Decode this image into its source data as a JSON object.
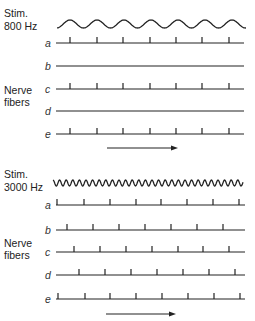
{
  "panels": [
    {
      "id": "800hz",
      "stim_label_line1": "Stim.",
      "stim_label_line2": "800 Hz",
      "stimulus_frequency_hz": 800,
      "wave": {
        "x_start": 57,
        "x_end": 246,
        "y_center": 24,
        "amplitude": 4,
        "period": 27,
        "phase_offset": 70
      },
      "group_label_line1": "Nerve",
      "group_label_line2": "fibers",
      "line_x_start": 56,
      "line_x_end": 244,
      "fibers": [
        {
          "label": "a",
          "y": 43,
          "ticks": [
            70,
            97,
            123,
            150,
            176,
            202,
            229
          ]
        },
        {
          "label": "b",
          "y": 66,
          "ticks": []
        },
        {
          "label": "c",
          "y": 89,
          "ticks": [
            70,
            97,
            123,
            150,
            176,
            202,
            229
          ]
        },
        {
          "label": "d",
          "y": 111,
          "ticks": []
        },
        {
          "label": "e",
          "y": 134,
          "ticks": [
            70,
            97,
            123,
            150,
            176,
            202,
            229
          ]
        }
      ],
      "arrow": {
        "x1": 107,
        "x2": 178,
        "y": 148,
        "meaning": "time"
      }
    },
    {
      "id": "3000hz",
      "stim_label_line1": "Stim.",
      "stim_label_line2": "3000 Hz",
      "stimulus_frequency_hz": 3000,
      "wave": {
        "x_start": 53,
        "x_end": 243,
        "y_center": 183,
        "amplitude": 3,
        "period": 6.6,
        "phase_offset": 53
      },
      "group_label_line1": "Nerve",
      "group_label_line2": "fibers",
      "line_x_start": 56,
      "line_x_end": 245,
      "fibers": [
        {
          "label": "a",
          "y": 205,
          "ticks": [
            57,
            84,
            110,
            136,
            161,
            187,
            213,
            239
          ]
        },
        {
          "label": "b",
          "y": 230,
          "ticks": [
            67,
            93,
            119,
            145,
            171,
            197,
            223
          ]
        },
        {
          "label": "c",
          "y": 252,
          "ticks": [
            74,
            100,
            126,
            152,
            178,
            203,
            229
          ]
        },
        {
          "label": "d",
          "y": 275,
          "ticks": [
            79,
            105,
            131,
            157,
            183,
            209,
            235
          ]
        },
        {
          "label": "e",
          "y": 299,
          "ticks": [
            58,
            85,
            110,
            136,
            162,
            188,
            214,
            240
          ]
        }
      ],
      "arrow": {
        "x1": 106,
        "x2": 176,
        "y": 314,
        "meaning": "time"
      }
    }
  ],
  "layout": {
    "stim_label_x": 4,
    "upper": {
      "stim_y1": 17,
      "stim_y2": 30,
      "group_y1": 94,
      "group_y2": 106
    },
    "lower": {
      "stim_y1": 178,
      "stim_y2": 191,
      "group_y1": 247,
      "group_y2": 259
    },
    "row_label_x": 45
  }
}
